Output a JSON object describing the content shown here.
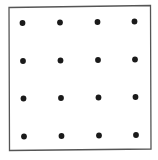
{
  "diagram": {
    "type": "dot-grid",
    "rows": 4,
    "columns": 4,
    "border": {
      "color": "#555555",
      "stroke_width": 1.3,
      "corners": [
        [
          9,
          7.5
        ],
        [
          150.5,
          5.5
        ],
        [
          151,
          149
        ],
        [
          9.5,
          150.5
        ]
      ]
    },
    "dot": {
      "color": "#1a1a1a",
      "radius": 2.9
    },
    "dots": [
      {
        "row": 1,
        "col": 1,
        "x": 22.5,
        "y": 23
      },
      {
        "row": 1,
        "col": 2,
        "x": 60,
        "y": 22.5
      },
      {
        "row": 1,
        "col": 3,
        "x": 97.5,
        "y": 22
      },
      {
        "row": 1,
        "col": 4,
        "x": 134.5,
        "y": 21.5
      },
      {
        "row": 2,
        "col": 1,
        "x": 23,
        "y": 61
      },
      {
        "row": 2,
        "col": 2,
        "x": 60.5,
        "y": 60.5
      },
      {
        "row": 2,
        "col": 3,
        "x": 98,
        "y": 60
      },
      {
        "row": 2,
        "col": 4,
        "x": 135,
        "y": 59.5
      },
      {
        "row": 3,
        "col": 1,
        "x": 23.5,
        "y": 98.5
      },
      {
        "row": 3,
        "col": 2,
        "x": 61,
        "y": 98
      },
      {
        "row": 3,
        "col": 3,
        "x": 98.5,
        "y": 97.5
      },
      {
        "row": 3,
        "col": 4,
        "x": 135.5,
        "y": 97
      },
      {
        "row": 4,
        "col": 1,
        "x": 24,
        "y": 136.5
      },
      {
        "row": 4,
        "col": 2,
        "x": 61.5,
        "y": 136
      },
      {
        "row": 4,
        "col": 3,
        "x": 99,
        "y": 135.5
      },
      {
        "row": 4,
        "col": 4,
        "x": 136,
        "y": 135
      }
    ]
  }
}
